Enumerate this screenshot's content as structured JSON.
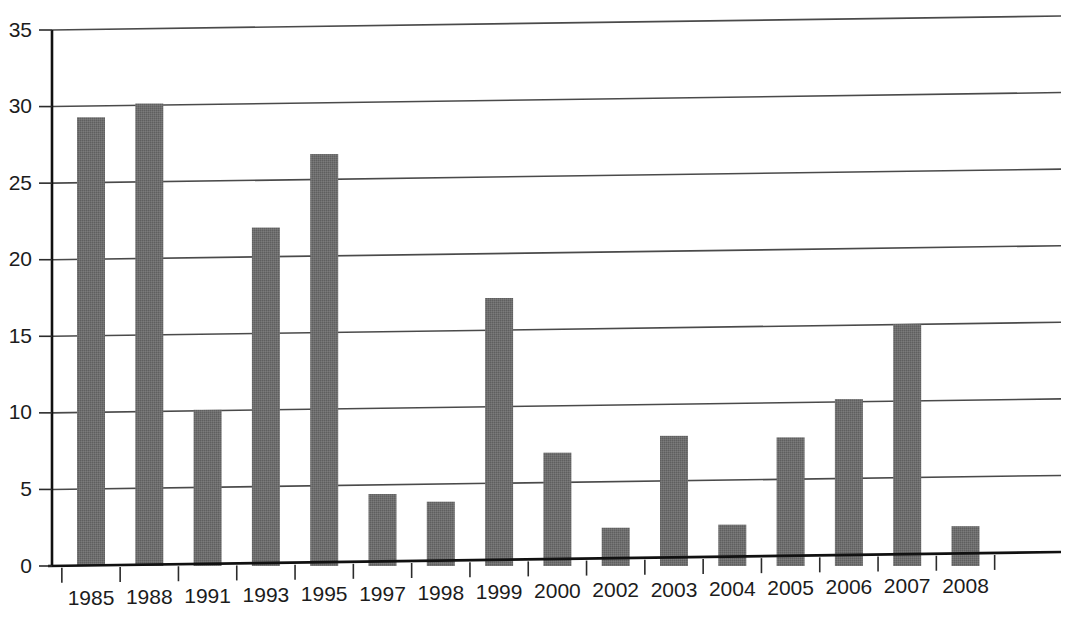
{
  "chart_data": {
    "type": "bar",
    "title": "",
    "subtitle": "",
    "xlabel": "",
    "ylabel": "",
    "categories": [
      "1985",
      "1988",
      "1991",
      "1993",
      "1995",
      "1997",
      "1998",
      "1999",
      "2000",
      "2002",
      "2003",
      "2004",
      "2005",
      "2006",
      "2007",
      "2008"
    ],
    "values": [
      29.3,
      30.2,
      10.2,
      22.1,
      26.9,
      4.7,
      4.2,
      17.5,
      7.4,
      2.5,
      8.5,
      2.7,
      8.4,
      10.9,
      15.8,
      2.6
    ],
    "ylim": [
      0,
      35
    ],
    "yticks": [
      0,
      5,
      10,
      15,
      20,
      25,
      30,
      35
    ],
    "ytick_labels": [
      "0",
      "5",
      "10",
      "15",
      "20",
      "25",
      "30",
      "35"
    ],
    "grid": true,
    "grid_axis": "y",
    "legend": false,
    "legend_position": "none",
    "series_name": "",
    "bar_color": "#6e6e6e",
    "bar_texture": "dither-checker",
    "axis_color": "#111111",
    "gridline_color": "#4a4a4a",
    "background_color": "#ffffff"
  },
  "axes": {
    "y_axis_name": "y-axis",
    "x_axis_name": "x-axis"
  }
}
